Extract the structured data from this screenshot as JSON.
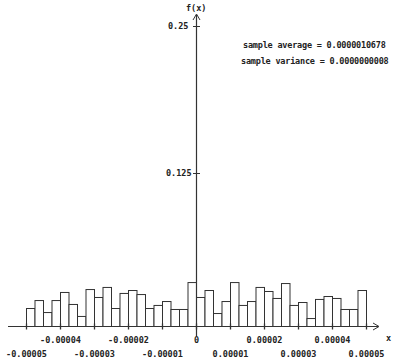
{
  "chart_data": {
    "type": "bar",
    "subtype": "histogram",
    "title": "",
    "xlabel": "x",
    "ylabel": "f(x)",
    "xlim": [
      -5e-05,
      5e-05
    ],
    "ylim": [
      0,
      0.25
    ],
    "grid": false,
    "legend": null,
    "bin_width": 2.5e-06,
    "bin_edges_start": -5e-05,
    "x_ticks_upper": [
      {
        "value": -4e-05,
        "label": "-0.00004"
      },
      {
        "value": -2e-05,
        "label": "-0.00002"
      },
      {
        "value": 0,
        "label": "0"
      },
      {
        "value": 2e-05,
        "label": "0.00002"
      },
      {
        "value": 4e-05,
        "label": "0.00004"
      }
    ],
    "x_ticks_lower": [
      {
        "value": -5e-05,
        "label": "-0.00005"
      },
      {
        "value": -3e-05,
        "label": "-0.00003"
      },
      {
        "value": -1e-05,
        "label": "-0.00001"
      },
      {
        "value": 1e-05,
        "label": "0.00001"
      },
      {
        "value": 3e-05,
        "label": "0.00003"
      },
      {
        "value": 5e-05,
        "label": "0.00005"
      }
    ],
    "y_ticks": [
      {
        "value": 0.125,
        "label": "0.125"
      },
      {
        "value": 0.25,
        "label": "0.25"
      }
    ],
    "values": [
      0.0147,
      0.0212,
      0.0114,
      0.0212,
      0.0278,
      0.018,
      0.0082,
      0.0302,
      0.0237,
      0.0319,
      0.0147,
      0.027,
      0.0294,
      0.0261,
      0.0147,
      0.0172,
      0.0204,
      0.0139,
      0.0139,
      0.0359,
      0.0237,
      0.0294,
      0.0106,
      0.0204,
      0.0359,
      0.0172,
      0.0204,
      0.0319,
      0.0286,
      0.0229,
      0.0351,
      0.0172,
      0.0196,
      0.0065,
      0.0221,
      0.0245,
      0.0229,
      0.0139,
      0.0139,
      0.0294
    ],
    "annotations": [
      {
        "text": "sample average = 0.0000010678"
      },
      {
        "text": "sample variance = 0.0000000008"
      }
    ]
  },
  "stats": {
    "average": "sample average = 0.0000010678",
    "variance": "sample variance = 0.0000000008"
  },
  "axes": {
    "y_label": "f(x)",
    "x_label": "x",
    "y_tick_top": "0.25",
    "y_tick_mid": "0.125"
  },
  "colors": {
    "bar_fill": "#ffffff",
    "bar_stroke": "#333333",
    "axis": "#333333",
    "background": "#ffffff"
  }
}
